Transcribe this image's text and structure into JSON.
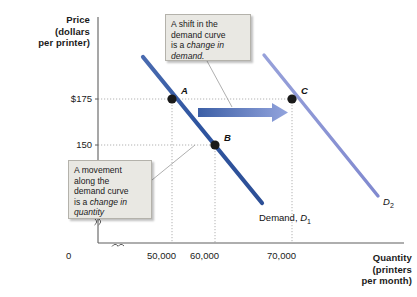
{
  "figure": {
    "type": "economics-demand-shift-diagram"
  },
  "axes": {
    "y": {
      "title_lines": [
        "Price",
        "(dollars",
        "per printer)"
      ],
      "ticks": [
        {
          "label": "$175",
          "value": 175
        },
        {
          "label": "150",
          "value": 150
        }
      ],
      "origin_label": "0",
      "has_break_mark": true
    },
    "x": {
      "title_lines": [
        "Quantity",
        "(printers",
        "per month)"
      ],
      "ticks": [
        {
          "label": "50,000",
          "value": 50000
        },
        {
          "label": "60,000",
          "value": 60000
        },
        {
          "label": "70,000",
          "value": 70000
        }
      ],
      "has_break_mark": true
    }
  },
  "curves": [
    {
      "id": "D1",
      "label_text": "Demand, ",
      "label_symbol": "D",
      "label_subscript": "1",
      "color": "#3a5fa8"
    },
    {
      "id": "D2",
      "label_text": "",
      "label_symbol": "D",
      "label_subscript": "2",
      "color": "#8a94d6"
    }
  ],
  "points": [
    {
      "label": "A",
      "price": 175,
      "quantity": 50000,
      "curve": "D1"
    },
    {
      "label": "B",
      "price": 150,
      "quantity": 60000,
      "curve": "D1"
    },
    {
      "label": "C",
      "price": 175,
      "quantity": 70000,
      "curve": "D2"
    }
  ],
  "shift_arrow": {
    "color_start": "#3c5fa6",
    "color_end": "#93a4dd",
    "from_quantity": 53000,
    "to_quantity": 70000,
    "at_price": 175
  },
  "callouts": {
    "shift": {
      "line1": "A shift in the",
      "line2": "demand curve",
      "line3_prefix": "is a ",
      "line3_em": "change in",
      "line4_em": "demand."
    },
    "movement": {
      "line1": "A movement",
      "line2": "along the",
      "line3": "demand curve",
      "line4_prefix": "is a ",
      "line4_em": "change in",
      "line5_em": "quantity",
      "line6_em": "demanded."
    }
  },
  "colors": {
    "d1_curve": "#3a5fa8",
    "d2_curve": "#8a94d6",
    "point_marker": "#1a1a1a",
    "gridline": "#9a9a9a",
    "axis": "#6b6b6b",
    "callout_bg": "#e9e8e3",
    "callout_border": "#b4b2ab",
    "leader_line": "#9a9a9a"
  }
}
